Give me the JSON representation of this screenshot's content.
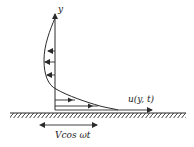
{
  "diagram": {
    "colors": {
      "stroke": "#2a2a2a",
      "background": "#ffffff"
    },
    "axis": {
      "label": "y"
    },
    "profile_label": "u(y, t)",
    "plate_motion_label": "Vcos ωt",
    "ground": {
      "style": "hatched"
    },
    "arrows": {
      "leftward_count": 3,
      "rightward_count": 3
    }
  }
}
